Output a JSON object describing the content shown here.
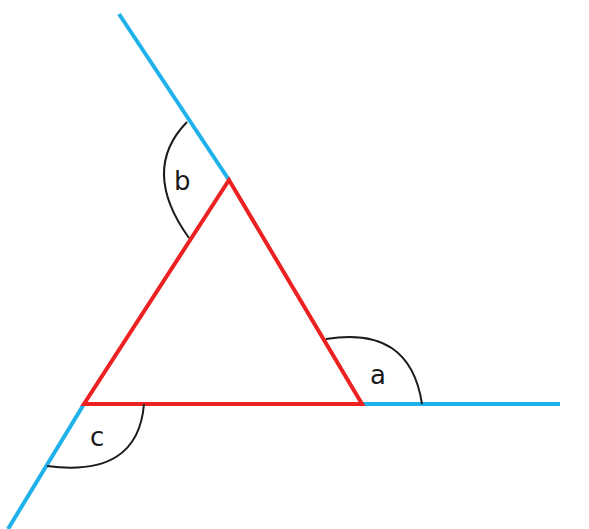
{
  "diagram": {
    "type": "triangle-exterior-angles",
    "colors": {
      "triangle": "#ec2121",
      "extension": "#1fb1ea",
      "arc": "#1a1a1a",
      "background": "#ffffff"
    },
    "vertices": {
      "top": [
        229,
        180
      ],
      "bottom_left": [
        84,
        404
      ],
      "bottom_right": [
        362,
        404
      ]
    },
    "extensions": [
      {
        "from": [
          229,
          180
        ],
        "to": [
          119,
          14
        ]
      },
      {
        "from": [
          362,
          404
        ],
        "to": [
          560,
          404
        ]
      },
      {
        "from": [
          84,
          404
        ],
        "to": [
          8,
          529
        ]
      }
    ],
    "angles": [
      {
        "label": "a",
        "vertex": "bottom_right"
      },
      {
        "label": "b",
        "vertex": "top"
      },
      {
        "label": "c",
        "vertex": "bottom_left"
      }
    ]
  }
}
